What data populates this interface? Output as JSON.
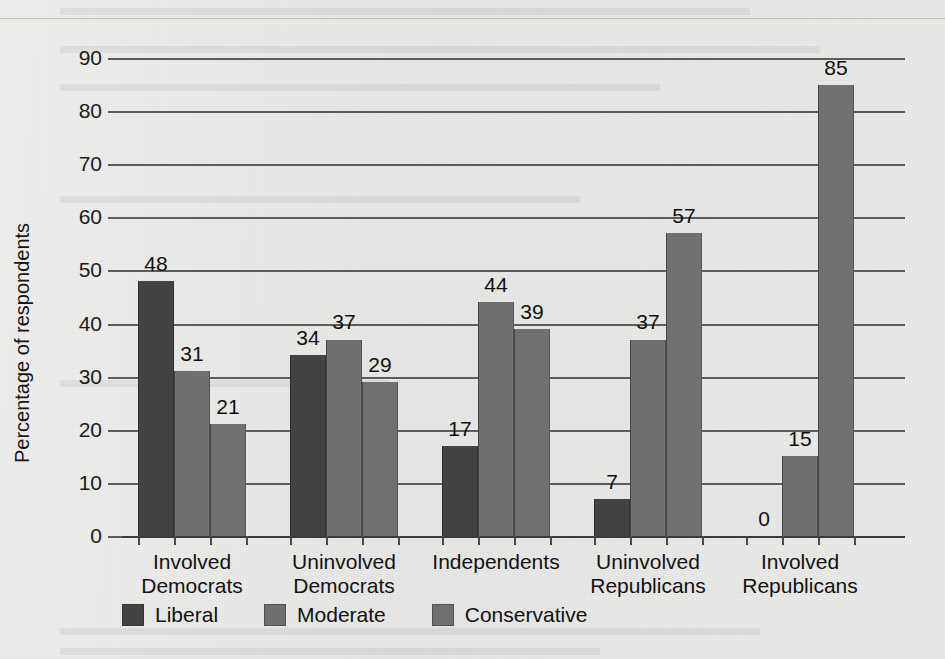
{
  "chart_data": {
    "type": "bar",
    "title": "",
    "xlabel": "",
    "ylabel": "Percentage of respondents",
    "ylim": [
      0,
      90
    ],
    "ytick_step": 10,
    "ytick_labels": [
      "0",
      "10",
      "20",
      "30",
      "40",
      "50",
      "60",
      "70",
      "80",
      "90"
    ],
    "grid": true,
    "legend_position": "bottom-left",
    "categories": [
      "Involved Democrats",
      "Uninvolved Democrats",
      "Independents",
      "Uninvolved Republicans",
      "Involved Republicans"
    ],
    "category_lines": [
      [
        "Involved",
        "Democrats"
      ],
      [
        "Uninvolved",
        "Democrats"
      ],
      [
        "Independents",
        ""
      ],
      [
        "Uninvolved",
        "Republicans"
      ],
      [
        "Involved",
        "Republicans"
      ]
    ],
    "series": [
      {
        "name": "Liberal",
        "color": "#434343",
        "values": [
          48,
          34,
          17,
          7,
          0
        ]
      },
      {
        "name": "Moderate",
        "color": "#6f6f6f",
        "values": [
          31,
          37,
          44,
          37,
          15
        ]
      },
      {
        "name": "Conservative",
        "color": "#707070",
        "values": [
          21,
          29,
          39,
          57,
          85
        ]
      }
    ],
    "value_labels": [
      [
        "48",
        "31",
        "21"
      ],
      [
        "34",
        "37",
        "29"
      ],
      [
        "17",
        "44",
        "39"
      ],
      [
        "7",
        "37",
        "57"
      ],
      [
        "0",
        "15",
        "85"
      ]
    ]
  },
  "legend": {
    "items": [
      {
        "label": "Liberal",
        "color": "#434343"
      },
      {
        "label": "Moderate",
        "color": "#6f6f6f"
      },
      {
        "label": "Conservative",
        "color": "#707070"
      }
    ]
  },
  "axis": {
    "y_label": "Percentage of respondents"
  }
}
